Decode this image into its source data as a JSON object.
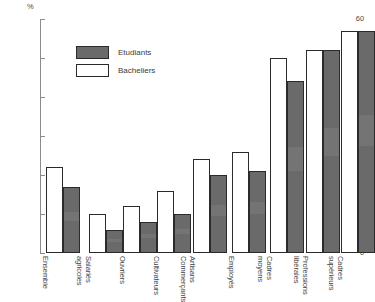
{
  "chart_data": {
    "type": "bar",
    "title": "",
    "xlabel": "",
    "ylabel": "%",
    "ylim": [
      0,
      60
    ],
    "yticks": [
      0,
      10,
      20,
      30,
      40,
      50,
      60
    ],
    "grid": false,
    "legend_position": "top-center",
    "categories": [
      "Ensemble",
      "Salariés agricoles",
      "Ouvriers",
      "Cultivateurs",
      "Artisans Commerçants",
      "Employés",
      "Cadres moyens",
      "Professions libérales",
      "Cadres supérieurs"
    ],
    "category_lines": [
      [
        "Ensemble",
        ""
      ],
      [
        "Salariés",
        "agricoles"
      ],
      [
        "Ouvriers",
        ""
      ],
      [
        "Cultivateurs",
        ""
      ],
      [
        "Artisans",
        "Commerçants"
      ],
      [
        "Employés",
        ""
      ],
      [
        "Cadres",
        "moyens"
      ],
      [
        "Professions",
        "libérales"
      ],
      [
        "Cadres",
        "supérieurs"
      ]
    ],
    "series": [
      {
        "name": "Bacheliers",
        "color": "#ffffff",
        "values": [
          22,
          10,
          12,
          16,
          24,
          26,
          50,
          52,
          57
        ]
      },
      {
        "name": "Etudiants",
        "color": "#6a6a6a",
        "values": [
          17,
          6,
          8,
          10,
          20,
          21,
          44,
          52,
          57
        ]
      }
    ]
  },
  "axis": {
    "unit_label": "%",
    "tick_labels": [
      "0",
      "10",
      "20",
      "30",
      "40",
      "50",
      "60"
    ]
  },
  "legend": {
    "items": [
      {
        "label": "Etudiants",
        "style": "dark"
      },
      {
        "label": "Bacheliers",
        "style": "light"
      }
    ]
  }
}
